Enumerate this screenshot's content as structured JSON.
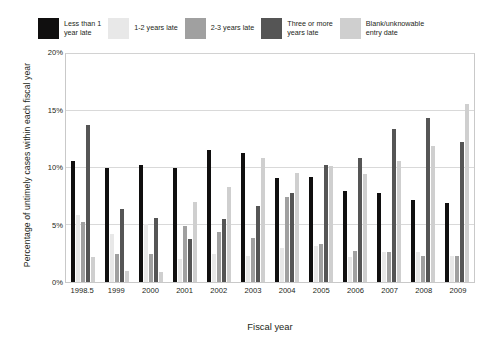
{
  "chart_data": {
    "type": "bar",
    "title": "",
    "xlabel": "Fiscal year",
    "ylabel": "Percentage of untimely cases within each fiscal year",
    "ylim": [
      0,
      20
    ],
    "yticks": [
      "0%",
      "5%",
      "10%",
      "15%",
      "20%"
    ],
    "ytick_values": [
      0,
      5,
      10,
      15,
      20
    ],
    "grid": true,
    "legend_position": "top",
    "categories": [
      "1998.5",
      "1999",
      "2000",
      "2001",
      "2002",
      "2003",
      "2004",
      "2005",
      "2006",
      "2007",
      "2008",
      "2009"
    ],
    "series": [
      {
        "name": "Less than 1 year late",
        "color": "#100f0f",
        "values": [
          10.6,
          10.0,
          10.3,
          10.0,
          11.6,
          11.3,
          9.1,
          9.2,
          8.0,
          7.8,
          7.2,
          6.9
        ]
      },
      {
        "name": "1-2 years late",
        "color": "#e8e8e8",
        "values": [
          5.9,
          4.2,
          5.1,
          2.0,
          2.5,
          2.3,
          3.0,
          3.2,
          2.2,
          2.6,
          2.6,
          2.3
        ]
      },
      {
        "name": "2-3 years late",
        "color": "#a0a0a0",
        "values": [
          5.3,
          2.5,
          2.5,
          4.9,
          4.4,
          3.9,
          7.5,
          3.3,
          2.7,
          2.6,
          2.3,
          2.3
        ]
      },
      {
        "name": "Three or more years late",
        "color": "#555555",
        "values": [
          13.8,
          6.4,
          5.6,
          3.8,
          5.5,
          6.7,
          7.8,
          10.3,
          10.9,
          13.4,
          14.4,
          12.3
        ]
      },
      {
        "name": "Blank/unknowable entry date",
        "color": "#cfcfcf",
        "values": [
          2.2,
          1.0,
          0.9,
          7.0,
          8.3,
          10.9,
          9.6,
          10.2,
          9.5,
          10.6,
          11.9,
          15.6
        ]
      }
    ]
  },
  "legend": {
    "entries": [
      {
        "label": "Less than 1\nyear late",
        "color": "#100f0f",
        "multiline": true
      },
      {
        "label": "1-2 years late",
        "color": "#e8e8e8",
        "multiline": false
      },
      {
        "label": "2-3 years late",
        "color": "#a0a0a0",
        "multiline": false
      },
      {
        "label": "Three or more\nyears late",
        "color": "#555555",
        "multiline": true
      },
      {
        "label": "Blank/unknowable\nentry date",
        "color": "#cfcfcf",
        "multiline": true
      }
    ]
  },
  "axes": {
    "y_title": "Percentage of untimely cases within each fiscal year",
    "x_title": "Fiscal year"
  },
  "colors": {
    "plot_border": "#c9c9c9",
    "gridline": "#d9d9d9",
    "text": "#231f20",
    "background": "#ffffff"
  }
}
